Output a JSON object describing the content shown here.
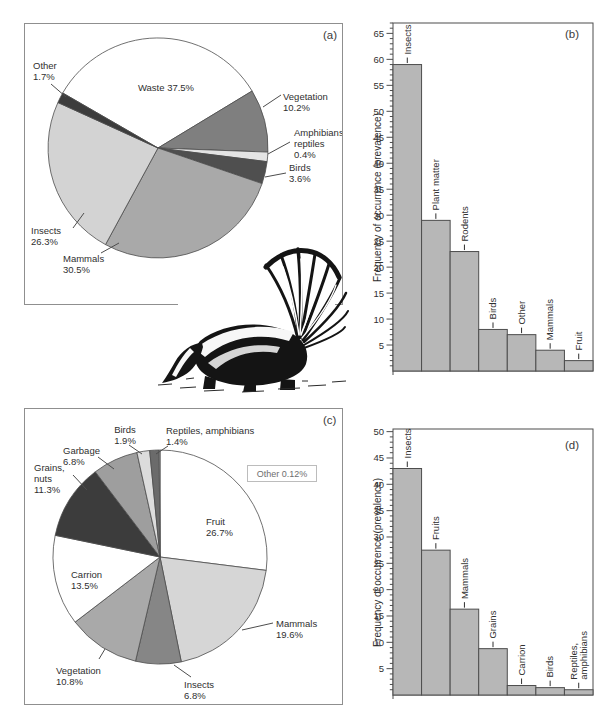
{
  "panels": {
    "a": {
      "letter": "(a)"
    },
    "b": {
      "letter": "(b)"
    },
    "c": {
      "letter": "(c)"
    },
    "d": {
      "letter": "(d)"
    }
  },
  "illustration": {
    "description": "striped skunk drawing"
  },
  "colors": {
    "axis": "#4d4d4d",
    "text": "#2f2f2f",
    "bar_fill": "#b7b7b7",
    "panel_border": "#8f8f8f"
  },
  "chart_data": [
    {
      "id": "a",
      "type": "pie",
      "slices": [
        {
          "label": "Waste",
          "pct": 37.5,
          "label_lines": [
            "Waste 37.5%"
          ],
          "color": "#ffffff"
        },
        {
          "label": "Vegetation",
          "pct": 10.2,
          "label_lines": [
            "Vegetation",
            "10.2%"
          ],
          "color": "#7f7f7f"
        },
        {
          "label": "Amphibians, reptiles",
          "pct": 0.4,
          "label_lines": [
            "Amphibians,",
            "reptiles",
            "0.4%"
          ],
          "color": "#e4e4e4"
        },
        {
          "label": "Birds",
          "pct": 3.6,
          "label_lines": [
            "Birds",
            "3.6%"
          ],
          "color": "#4f4f4f"
        },
        {
          "label": "Mammals",
          "pct": 30.5,
          "label_lines": [
            "Mammals",
            "30.5%"
          ],
          "color": "#a9a9a9"
        },
        {
          "label": "Insects",
          "pct": 26.3,
          "label_lines": [
            "Insects",
            "26.3%"
          ],
          "color": "#d3d3d3"
        },
        {
          "label": "Other",
          "pct": 1.7,
          "label_lines": [
            "Other",
            "1.7%"
          ],
          "color": "#3c3c3c"
        }
      ]
    },
    {
      "id": "b",
      "type": "bar",
      "ylabel": "Frequency of occurrence (prevalence)",
      "ylim": [
        0,
        67
      ],
      "yticks": [
        5,
        10,
        15,
        20,
        25,
        30,
        35,
        40,
        45,
        50,
        55,
        60,
        65
      ],
      "ytick_minor_step": 1,
      "categories": [
        "Insects",
        "Plant matter",
        "Rodents",
        "Birds",
        "Other",
        "Mammals",
        "Fruit"
      ],
      "label_lines": [
        [
          "Insects"
        ],
        [
          "Plant matter"
        ],
        [
          "Rodents"
        ],
        [
          "Birds"
        ],
        [
          "Other"
        ],
        [
          "Mammals"
        ],
        [
          "Fruit"
        ]
      ],
      "values": [
        59,
        29,
        23,
        8,
        7,
        4,
        2
      ],
      "bar_color": "#b7b7b7"
    },
    {
      "id": "c",
      "type": "pie",
      "other_note": "Other 0.12%",
      "slices": [
        {
          "label": "Fruit",
          "pct": 26.7,
          "label_lines": [
            "Fruit",
            "26.7%"
          ],
          "color": "#ffffff"
        },
        {
          "label": "Mammals",
          "pct": 19.6,
          "label_lines": [
            "Mammals",
            "19.6%"
          ],
          "color": "#d6d6d6"
        },
        {
          "label": "Insects",
          "pct": 6.8,
          "label_lines": [
            "Insects",
            "6.8%"
          ],
          "color": "#868686"
        },
        {
          "label": "Vegetation",
          "pct": 10.8,
          "label_lines": [
            "Vegetation",
            "10.8%"
          ],
          "color": "#a9a9a9"
        },
        {
          "label": "Carrion",
          "pct": 13.5,
          "label_lines": [
            "Carrion",
            "13.5%"
          ],
          "color": "#ffffff"
        },
        {
          "label": "Grains, nuts",
          "pct": 11.3,
          "label_lines": [
            "Grains,",
            "nuts",
            "11.3%"
          ],
          "color": "#3c3c3c"
        },
        {
          "label": "Garbage",
          "pct": 6.8,
          "label_lines": [
            "Garbage",
            "6.8%"
          ],
          "color": "#9e9e9e"
        },
        {
          "label": "Birds",
          "pct": 1.9,
          "label_lines": [
            "Birds",
            "1.9%"
          ],
          "color": "#dcdcdc"
        },
        {
          "label": "Reptiles, amphibians",
          "pct": 1.4,
          "label_lines": [
            "Reptiles, amphibians",
            "1.4%"
          ],
          "color": "#6b6b6b"
        },
        {
          "label": "Other",
          "pct": 0.12,
          "label_lines": [],
          "color": "#ffffff"
        }
      ]
    },
    {
      "id": "d",
      "type": "bar",
      "ylabel": "Frequency of occurrence (prevalence)",
      "ylim": [
        0,
        50.5
      ],
      "yticks": [
        5,
        10,
        15,
        20,
        25,
        30,
        35,
        40,
        45,
        50
      ],
      "ytick_minor_step": 1,
      "categories": [
        "Insects",
        "Fruits",
        "Mammals",
        "Grains",
        "Carrion",
        "Birds",
        "Reptiles, amphibians"
      ],
      "label_lines": [
        [
          "Insects"
        ],
        [
          "Fruits"
        ],
        [
          "Mammals"
        ],
        [
          "Grains"
        ],
        [
          "Carrion"
        ],
        [
          "Birds"
        ],
        [
          "Reptiles,",
          "amphibians"
        ]
      ],
      "values": [
        43,
        27.5,
        16.3,
        8.8,
        1.8,
        1.4,
        1.0
      ],
      "bar_color": "#b7b7b7"
    }
  ]
}
